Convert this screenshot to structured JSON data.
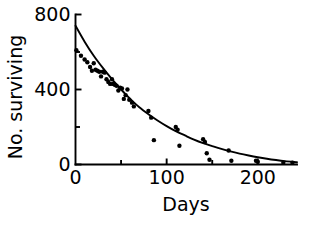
{
  "chart_data": {
    "type": "scatter",
    "title": "",
    "subtitle": "",
    "xlabel": "Days",
    "ylabel": "No. surviving",
    "xlim": [
      0,
      243
    ],
    "ylim": [
      0,
      800
    ],
    "grid": false,
    "legend": null,
    "x_ticks_major": [
      0,
      100,
      200
    ],
    "x_tick_labels": [
      "0",
      "100",
      "200"
    ],
    "x_ticks_minor": [
      50,
      150
    ],
    "y_ticks_major": [
      0,
      400,
      800
    ],
    "y_tick_labels": [
      "0",
      "400",
      "800"
    ],
    "y_ticks_minor": [
      200,
      600
    ],
    "series": [
      {
        "name": "observed survivors",
        "type": "scatter",
        "marker": "filled-circle",
        "color": "#000000",
        "points": [
          [
            1,
            610
          ],
          [
            6,
            580
          ],
          [
            10,
            560
          ],
          [
            13,
            545
          ],
          [
            16,
            520
          ],
          [
            18,
            500
          ],
          [
            20,
            540
          ],
          [
            22,
            505
          ],
          [
            24,
            500
          ],
          [
            26,
            495
          ],
          [
            28,
            470
          ],
          [
            30,
            495
          ],
          [
            32,
            490
          ],
          [
            34,
            455
          ],
          [
            36,
            440
          ],
          [
            38,
            430
          ],
          [
            40,
            455
          ],
          [
            41,
            430
          ],
          [
            43,
            425
          ],
          [
            45,
            420
          ],
          [
            47,
            395
          ],
          [
            49,
            410
          ],
          [
            51,
            405
          ],
          [
            53,
            350
          ],
          [
            55,
            370
          ],
          [
            57,
            400
          ],
          [
            59,
            345
          ],
          [
            62,
            330
          ],
          [
            64,
            310
          ],
          [
            80,
            285
          ],
          [
            83,
            250
          ],
          [
            86,
            130
          ],
          [
            110,
            200
          ],
          [
            112,
            185
          ],
          [
            114,
            100
          ],
          [
            140,
            135
          ],
          [
            142,
            120
          ],
          [
            144,
            60
          ],
          [
            147,
            25
          ],
          [
            168,
            75
          ],
          [
            171,
            20
          ],
          [
            198,
            20
          ],
          [
            200,
            15
          ],
          [
            228,
            10
          ],
          [
            238,
            10
          ]
        ]
      },
      {
        "name": "fitted exponential decay",
        "type": "line",
        "color": "#000000",
        "points": [
          [
            0,
            740
          ],
          [
            10,
            655
          ],
          [
            20,
            580
          ],
          [
            30,
            515
          ],
          [
            40,
            455
          ],
          [
            50,
            400
          ],
          [
            60,
            350
          ],
          [
            70,
            305
          ],
          [
            80,
            268
          ],
          [
            90,
            235
          ],
          [
            100,
            205
          ],
          [
            110,
            178
          ],
          [
            120,
            155
          ],
          [
            130,
            133
          ],
          [
            140,
            114
          ],
          [
            150,
            98
          ],
          [
            160,
            83
          ],
          [
            170,
            70
          ],
          [
            180,
            58
          ],
          [
            190,
            48
          ],
          [
            200,
            39
          ],
          [
            210,
            31
          ],
          [
            220,
            24
          ],
          [
            230,
            18
          ],
          [
            243,
            12
          ]
        ]
      }
    ]
  },
  "axes": {
    "x_title": "Days",
    "y_title": "No. surviving"
  },
  "colors": {
    "ink": "#000000",
    "background": "#ffffff"
  }
}
